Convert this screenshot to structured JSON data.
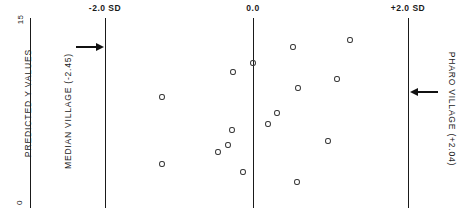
{
  "chart_data": {
    "type": "scatter",
    "title": "",
    "xlabel": "",
    "ylabel": "PREDICTED Y VALUES",
    "ylim": [
      0,
      15
    ],
    "ytick_labels": [
      "15",
      "0"
    ],
    "grid": false,
    "legend": "none",
    "x_axis_units": "standard deviations (SD)",
    "reference_lines": [
      {
        "label": "-2.0 SD",
        "value": -2.0,
        "px_x": 105
      },
      {
        "label": "0.0",
        "value": 0.0,
        "px_x": 253
      },
      {
        "label": "+2.0 SD",
        "value": 2.0,
        "px_x": 408
      }
    ],
    "annotations": [
      {
        "text": "MEDIAN VILLAGE (-2.45)",
        "value": -2.45,
        "arrow": "right",
        "points_to": "-2.0 SD"
      },
      {
        "text": "PHARO VILLAGE (+2.04)",
        "value": 2.04,
        "arrow": "left",
        "points_to": "+2.0 SD"
      }
    ],
    "points": [
      {
        "x": -1.24,
        "y": 6.66,
        "px_x": 162,
        "px_y": 97
      },
      {
        "x": -1.24,
        "y": 3.47,
        "px_x": 162,
        "px_y": 164
      },
      {
        "x": -0.28,
        "y": 5.92,
        "px_x": 232,
        "px_y": 130
      },
      {
        "x": -0.34,
        "y": 4.74,
        "px_x": 228,
        "px_y": 145
      },
      {
        "x": -0.47,
        "y": 4.18,
        "px_x": 218,
        "px_y": 152
      },
      {
        "x": -0.13,
        "y": 2.84,
        "px_x": 243,
        "px_y": 172
      },
      {
        "x": -0.27,
        "y": 8.66,
        "px_x": 233,
        "px_y": 72
      },
      {
        "x": 0.0,
        "y": 9.37,
        "px_x": 253,
        "px_y": 63
      },
      {
        "x": 0.52,
        "y": 10.63,
        "px_x": 293,
        "px_y": 47
      },
      {
        "x": 0.58,
        "y": 7.4,
        "px_x": 298,
        "px_y": 88
      },
      {
        "x": 0.31,
        "y": 5.68,
        "px_x": 277,
        "px_y": 113
      },
      {
        "x": 0.19,
        "y": 4.82,
        "px_x": 268,
        "px_y": 124
      },
      {
        "x": 0.97,
        "y": 3.47,
        "px_x": 328,
        "px_y": 141
      },
      {
        "x": 0.57,
        "y": 1.34,
        "px_x": 297,
        "px_y": 182
      },
      {
        "x": 1.28,
        "y": 11.18,
        "px_x": 350,
        "px_y": 40
      },
      {
        "x": 1.1,
        "y": 8.11,
        "px_x": 337,
        "px_y": 79
      }
    ]
  },
  "axis": {
    "y_title": "PREDICTED Y VALUES",
    "y_max_label": "15",
    "y_min_label": "0"
  },
  "labels": {
    "left_ref": "-2.0 SD",
    "center_ref": "0.0",
    "right_ref": "+2.0 SD",
    "median_village": "MEDIAN VILLAGE (-2.45)",
    "pharo_village": "PHARO VILLAGE (+2.04)"
  },
  "colors": {
    "ink": "#1a1a1a",
    "marker": "#3a3a3a",
    "background": "#ffffff"
  }
}
